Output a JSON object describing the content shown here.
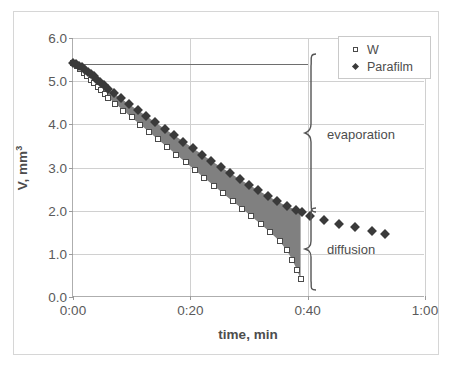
{
  "chart_data": {
    "type": "scatter",
    "title": "",
    "xlabel": "time, min",
    "ylabel": "V, mm3",
    "ylabel_display": "V, mm",
    "ylabel_exponent": "3",
    "xtick_labels": [
      "0:00",
      "0:20",
      "0:40",
      "1:00"
    ],
    "xtick_values": [
      0,
      20,
      40,
      60
    ],
    "ytick_labels": [
      "0.0",
      "1.0",
      "2.0",
      "3.0",
      "4.0",
      "5.0",
      "6.0"
    ],
    "ytick_values": [
      0,
      1,
      2,
      3,
      4,
      5,
      6
    ],
    "xlim": [
      0,
      60
    ],
    "ylim": [
      0,
      6
    ],
    "grid": true,
    "legend_position": "top-right",
    "series": [
      {
        "name": "W",
        "marker": "open-square",
        "color": "#4a4a4a",
        "x": [
          0.0,
          0.6,
          1.2,
          1.8,
          2.4,
          3.0,
          3.6,
          4.2,
          4.8,
          5.4,
          6.0,
          7.2,
          8.6,
          10.0,
          11.5,
          13.0,
          14.5,
          16.0,
          17.6,
          19.2,
          20.8,
          22.4,
          24.0,
          25.6,
          27.2,
          28.8,
          30.4,
          32.0,
          33.6,
          35.2,
          36.4,
          37.4,
          38.2,
          38.8
        ],
        "y": [
          5.42,
          5.36,
          5.28,
          5.2,
          5.12,
          5.03,
          4.95,
          4.87,
          4.79,
          4.71,
          4.62,
          4.48,
          4.32,
          4.16,
          3.99,
          3.82,
          3.65,
          3.48,
          3.3,
          3.12,
          2.94,
          2.76,
          2.58,
          2.4,
          2.22,
          2.05,
          1.87,
          1.69,
          1.5,
          1.3,
          1.09,
          0.86,
          0.62,
          0.42
        ]
      },
      {
        "name": "Parafilm",
        "marker": "filled-diamond",
        "color": "#3a3a3a",
        "x": [
          0.0,
          0.5,
          1.0,
          1.5,
          2.0,
          2.5,
          3.0,
          3.5,
          4.0,
          4.6,
          5.2,
          6.0,
          7.0,
          8.2,
          9.6,
          11.0,
          12.5,
          14.0,
          15.6,
          17.2,
          18.8,
          20.4,
          22.0,
          23.6,
          25.2,
          26.8,
          28.4,
          30.0,
          31.6,
          33.2,
          34.8,
          36.4,
          38.0,
          39.0,
          40.4,
          42.8,
          45.4,
          48.0,
          51.0,
          53.2
        ],
        "y": [
          5.43,
          5.4,
          5.36,
          5.32,
          5.27,
          5.22,
          5.17,
          5.12,
          5.06,
          4.99,
          4.92,
          4.83,
          4.72,
          4.6,
          4.46,
          4.33,
          4.19,
          4.05,
          3.9,
          3.75,
          3.6,
          3.45,
          3.3,
          3.15,
          3.01,
          2.87,
          2.73,
          2.6,
          2.47,
          2.34,
          2.22,
          2.11,
          2.02,
          1.97,
          1.88,
          1.78,
          1.7,
          1.62,
          1.53,
          1.46
        ]
      }
    ],
    "fill_between": {
      "between": [
        "W",
        "Parafilm"
      ],
      "color": "#808080",
      "x_range": [
        0,
        38.8
      ]
    },
    "reference_line": {
      "y": 5.4,
      "x_start": 1.5,
      "x_end": 40,
      "color": "#6e6e6e"
    },
    "annotations": [
      {
        "label": "evaporation",
        "brace_y_top": 5.4,
        "brace_y_bottom": 2.0,
        "brace_x": 40
      },
      {
        "label": "diffusion",
        "brace_y_top": 2.0,
        "brace_y_bottom": 0.12,
        "brace_x": 40
      }
    ]
  }
}
